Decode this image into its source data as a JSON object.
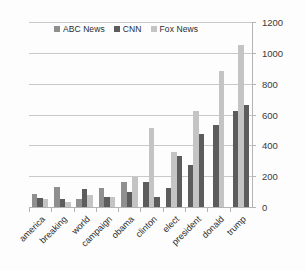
{
  "chart_data": {
    "type": "bar",
    "title": "",
    "subtitle": "",
    "xlabel": "",
    "ylabel": "",
    "ylim": [
      0,
      1200
    ],
    "yticks": [
      0,
      200,
      400,
      600,
      800,
      1000,
      1200
    ],
    "ytick_labels": [
      "0",
      "200",
      "400",
      "600",
      "800",
      "1000",
      "1200"
    ],
    "grid": true,
    "axis_position": "right",
    "legend_position": "top-center",
    "categories": [
      "america",
      "breaking",
      "world",
      "campaign",
      "obama",
      "clinton",
      "elect",
      "president",
      "donald",
      "trump"
    ],
    "series": [
      {
        "name": "ABC News",
        "color": "#8f8f8f",
        "values": [
          85,
          130,
          55,
          125,
          160,
          0,
          0,
          0,
          0,
          0
        ]
      },
      {
        "name": "CNN",
        "color": "#5c5c5c",
        "values": [
          60,
          50,
          120,
          65,
          100,
          165,
          125,
          275,
          530,
          625
        ]
      },
      {
        "name": "Fox News",
        "color": "#c4c4c4",
        "values": [
          50,
          30,
          75,
          65,
          195,
          510,
          355,
          620,
          880,
          1050
        ]
      }
    ],
    "series_extra": [
      {
        "name": "series-extra-clinton-elect-president-trump",
        "color": "#5c5c5c",
        "values": [
          0,
          0,
          0,
          0,
          0,
          65,
          330,
          475,
          0,
          660
        ]
      }
    ]
  },
  "legend": {
    "items": [
      {
        "label": "ABC News",
        "color": "#8f8f8f"
      },
      {
        "label": "CNN",
        "color": "#5c5c5c"
      },
      {
        "label": "Fox News",
        "color": "#c4c4c4"
      }
    ]
  },
  "yaxis": {
    "ticks": [
      {
        "label": "1200",
        "value": 1200
      },
      {
        "label": "1000",
        "value": 1000
      },
      {
        "label": "800",
        "value": 800
      },
      {
        "label": "600",
        "value": 600
      },
      {
        "label": "400",
        "value": 400
      },
      {
        "label": "200",
        "value": 200
      },
      {
        "label": "0",
        "value": 0
      }
    ]
  },
  "xaxis": {
    "labels": [
      "america",
      "breaking",
      "world",
      "campaign",
      "obama",
      "clinton",
      "elect",
      "president",
      "donald",
      "trump"
    ]
  }
}
